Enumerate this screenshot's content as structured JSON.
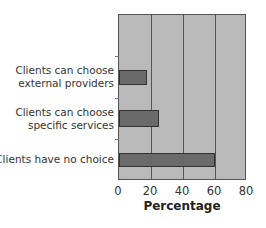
{
  "chart_data": {
    "type": "bar",
    "orientation": "horizontal",
    "title": "",
    "xlabel": "Percentage",
    "ylabel": "",
    "xlim": [
      0,
      80
    ],
    "xticks": [
      "0",
      "20",
      "40",
      "60",
      "80"
    ],
    "grid": true,
    "categories": [
      "Clients can choose external providers",
      "Clients can choose specific services",
      "Clients have no choice"
    ],
    "category_lines": [
      [
        "Clients can choose",
        "external providers"
      ],
      [
        "Clients can choose",
        "specific services"
      ],
      [
        "Clients have no choice"
      ]
    ],
    "values": [
      17.5,
      25,
      60
    ],
    "colors": {
      "plot_bg": "#b9b9b9",
      "bar": "#6a6a6a",
      "gridline": "#555555"
    }
  }
}
